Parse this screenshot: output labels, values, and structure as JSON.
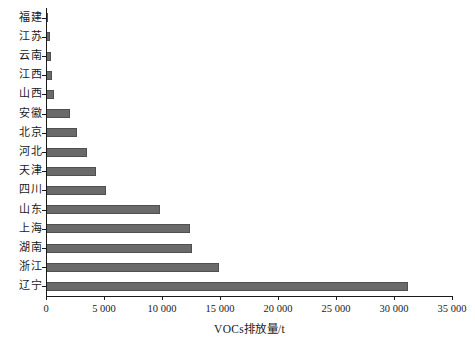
{
  "chart_data": {
    "type": "bar",
    "orientation": "horizontal",
    "title": "",
    "xlabel": "VOCs排放量/t",
    "ylabel": "",
    "xlim": [
      0,
      35000
    ],
    "xticks": [
      0,
      5000,
      10000,
      15000,
      20000,
      25000,
      30000,
      35000
    ],
    "xtick_labels": [
      "0",
      "5 000",
      "10 000",
      "15 000",
      "20 000",
      "25 000",
      "30 000",
      "35 000"
    ],
    "grid": false,
    "legend": null,
    "bar_color": "#6a6a6a",
    "bar_edge_color": "#4f4f4f",
    "axis_color": "#1a1a1a",
    "categories": [
      "福建",
      "江苏",
      "云南",
      "江西",
      "山西",
      "安徽",
      "北京",
      "河北",
      "天津",
      "四川",
      "山东",
      "上海",
      "湖南",
      "浙江",
      "辽宁"
    ],
    "values": [
      120,
      320,
      430,
      560,
      720,
      2050,
      2700,
      3550,
      4350,
      5200,
      9800,
      12400,
      12550,
      14950,
      31200
    ],
    "series": [
      {
        "name": "VOCs排放量",
        "values": [
          120,
          320,
          430,
          560,
          720,
          2050,
          2700,
          3550,
          4350,
          5200,
          9800,
          12400,
          12550,
          14950,
          31200
        ]
      }
    ]
  },
  "caption": ""
}
